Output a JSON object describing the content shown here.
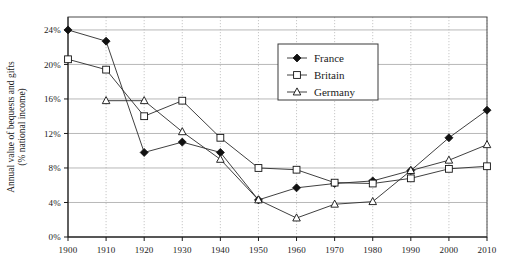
{
  "chart_data": {
    "type": "line",
    "title": "",
    "xlabel": "",
    "ylabel": "Annual value of bequests and gifts",
    "ylabel_line2": "(% national income)",
    "x": [
      1900,
      1910,
      1920,
      1930,
      1940,
      1950,
      1960,
      1970,
      1980,
      1990,
      2000,
      2010
    ],
    "xtick_labels": [
      "1900",
      "1910",
      "1920",
      "1930",
      "1940",
      "1950",
      "1960",
      "1970",
      "1980",
      "1990",
      "2000",
      "2010"
    ],
    "ytick_labels": [
      "0%",
      "4%",
      "8%",
      "12%",
      "16%",
      "20%",
      "24%"
    ],
    "ytick_values": [
      0,
      4,
      8,
      12,
      16,
      20,
      24
    ],
    "ylim": [
      0,
      25.5
    ],
    "xlim": [
      1900,
      2010
    ],
    "grid": "horizontal-solid-and-vertical-dotted",
    "legend_position": "top-center-right",
    "series": [
      {
        "name": "France",
        "marker": "filled-diamond",
        "values": [
          24.0,
          22.7,
          9.8,
          11.0,
          9.8,
          4.3,
          5.7,
          6.2,
          6.5,
          7.7,
          11.5,
          14.7
        ]
      },
      {
        "name": "Britain",
        "marker": "open-square",
        "values": [
          20.6,
          19.4,
          14.0,
          15.8,
          11.5,
          8.0,
          7.8,
          6.3,
          6.2,
          6.8,
          7.9,
          8.2
        ]
      },
      {
        "name": "Germany",
        "marker": "open-triangle",
        "values": [
          null,
          15.8,
          15.8,
          12.2,
          9.0,
          4.3,
          2.2,
          3.8,
          4.1,
          7.7,
          8.9,
          10.7
        ]
      }
    ]
  },
  "legend": {
    "entries": [
      {
        "label": "France",
        "marker": "filled-diamond"
      },
      {
        "label": "Britain",
        "marker": "open-square"
      },
      {
        "label": "Germany",
        "marker": "open-triangle"
      }
    ]
  }
}
